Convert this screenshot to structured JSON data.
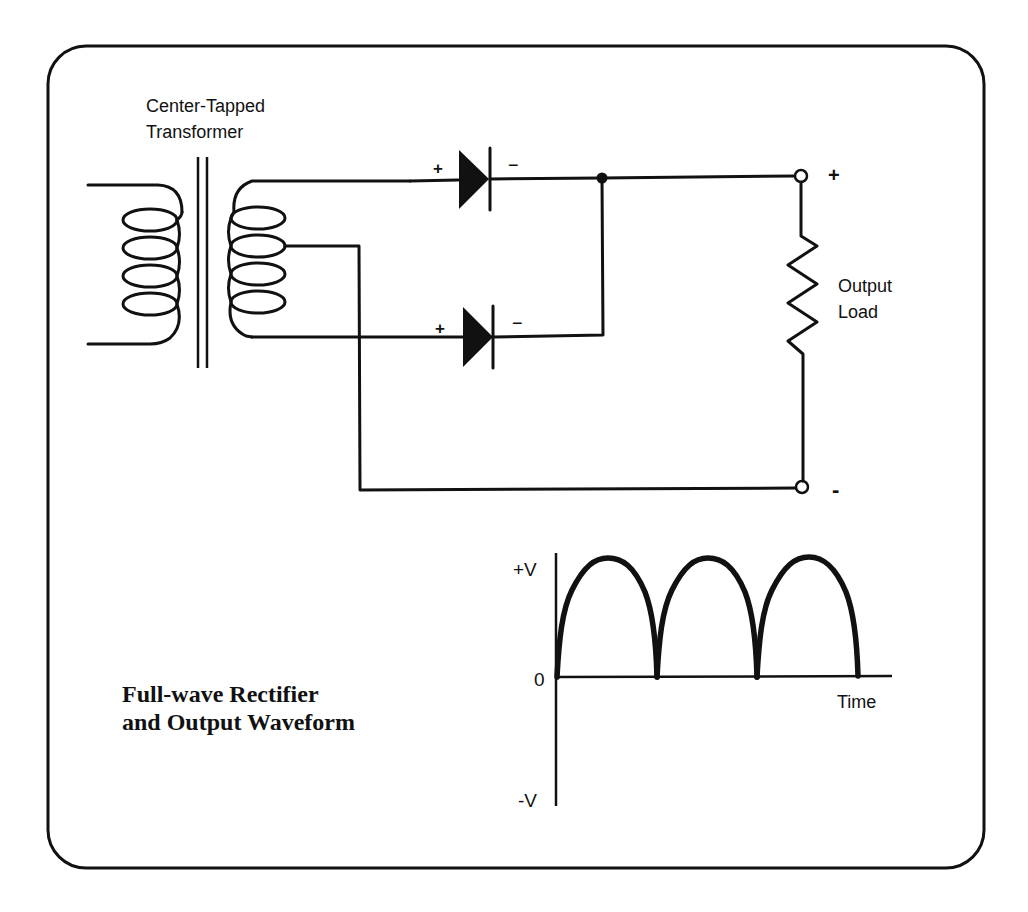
{
  "figure": {
    "title_line1": "Full-wave Rectifier",
    "title_line2": "and Output Waveform"
  },
  "transformer": {
    "label_line1": "Center-Tapped",
    "label_line2": "Transformer",
    "primary_turns": 4,
    "secondary_turns": 4
  },
  "diodes": [
    {
      "name": "upper",
      "anode_label": "+",
      "cathode_label": "−"
    },
    {
      "name": "lower",
      "anode_label": "+",
      "cathode_label": "−"
    }
  ],
  "load": {
    "label_line1": "Output",
    "label_line2": "Load",
    "positive_terminal": "+",
    "negative_terminal": "-"
  },
  "waveform": {
    "y_labels": {
      "top": "+V",
      "zero": "0",
      "bottom": "-V"
    },
    "x_label": "Time",
    "half_cycles": 3
  },
  "colors": {
    "ink": "#111111",
    "background": "#ffffff"
  }
}
